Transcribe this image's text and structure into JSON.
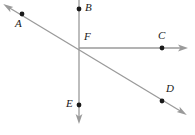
{
  "figure": {
    "canvas": {
      "width": 195,
      "height": 135,
      "background": "#ffffff"
    },
    "style": {
      "line_color": "#9a9a9a",
      "line_width": 1.3,
      "point_color": "#1a1a1a",
      "point_radius": 2.4,
      "label_color": "#1a1a1a",
      "label_font_size": 11,
      "label_style": "italic"
    },
    "points": [
      {
        "id": "A",
        "label": "A",
        "x": 22,
        "y": 14,
        "label_x": 15,
        "label_y": 18,
        "on": "diagonal-line"
      },
      {
        "id": "B",
        "label": "B",
        "x": 79,
        "y": 9,
        "label_x": 85,
        "label_y": 2,
        "on": "vertical-line"
      },
      {
        "id": "C",
        "label": "C",
        "x": 162,
        "y": 48,
        "label_x": 158,
        "label_y": 30,
        "on": "horizontal-ray"
      },
      {
        "id": "D",
        "label": "D",
        "x": 162,
        "y": 101,
        "label_x": 166,
        "label_y": 83,
        "on": "diagonal-line"
      },
      {
        "id": "E",
        "label": "E",
        "x": 79,
        "y": 105,
        "label_x": 66,
        "label_y": 98,
        "on": "vertical-line"
      },
      {
        "id": "F",
        "label": "F",
        "x": 79,
        "y": 48,
        "label_x": 84,
        "label_y": 31,
        "on": "intersection"
      }
    ],
    "lines": [
      {
        "id": "vertical-line",
        "name": "line-B-E",
        "x1": 79,
        "y1": 0,
        "x2": 79,
        "y2": 120,
        "arrow_start": false,
        "arrow_end": true,
        "through": [
          "B",
          "F",
          "E"
        ]
      },
      {
        "id": "horizontal-ray",
        "name": "ray-F-C",
        "x1": 79,
        "y1": 48,
        "x2": 184,
        "y2": 48,
        "arrow_start": false,
        "arrow_end": true,
        "through": [
          "F",
          "C"
        ]
      },
      {
        "id": "diagonal-line",
        "name": "line-A-D",
        "x1": 7,
        "y1": 6,
        "x2": 183,
        "y2": 113,
        "arrow_start": true,
        "arrow_end": true,
        "through": [
          "A",
          "F",
          "D"
        ]
      }
    ]
  }
}
